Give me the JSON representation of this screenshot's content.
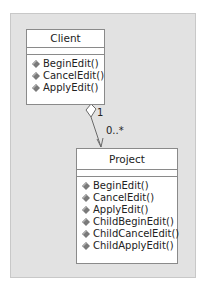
{
  "diagram": {
    "type": "UML class diagram",
    "classes": [
      {
        "name": "Client",
        "attributes": [],
        "operations": [
          "BeginEdit()",
          "CancelEdit()",
          "ApplyEdit()"
        ]
      },
      {
        "name": "Project",
        "attributes": [],
        "operations": [
          "BeginEdit()",
          "CancelEdit()",
          "ApplyEdit()",
          "ChildBeginEdit()",
          "ChildCancelEdit()",
          "ChildApplyEdit()"
        ]
      }
    ],
    "association": {
      "kind": "aggregation",
      "from": "Client",
      "to": "Project",
      "from_multiplicity": "1",
      "to_multiplicity": "0..*"
    },
    "operation_icon": "method-icon"
  },
  "colors": {
    "panel": "#e2e2e2",
    "box_border": "#8a8a8a",
    "icon": "#7a7a7a"
  }
}
